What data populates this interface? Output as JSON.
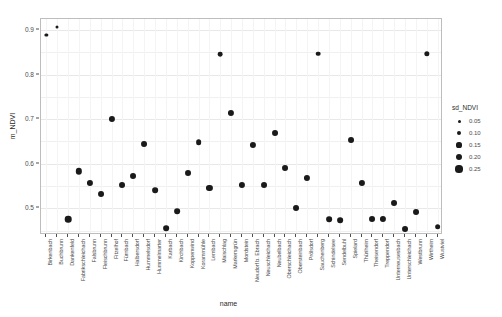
{
  "chart_data": {
    "type": "scatter",
    "title": "",
    "xlabel": "name",
    "ylabel": "m_NDVI",
    "ylim": [
      0.44,
      0.925
    ],
    "yticks": [
      "0.5",
      "0.6",
      "0.7",
      "0.8",
      "0.9"
    ],
    "ytick_values": [
      0.5,
      0.6,
      0.7,
      0.8,
      0.9
    ],
    "grid": true,
    "legend": {
      "title": "sd_NDVI",
      "position": "right",
      "entries": [
        {
          "label": "0.05",
          "value": 0.05,
          "size_px": 3.0
        },
        {
          "label": "0.10",
          "value": 0.1,
          "size_px": 4.2
        },
        {
          "label": "0.15",
          "value": 0.15,
          "size_px": 5.2
        },
        {
          "label": "0.20",
          "value": 0.2,
          "size_px": 6.2
        },
        {
          "label": "0.25",
          "value": 0.25,
          "size_px": 7.2
        }
      ]
    },
    "categories": [
      "Birkenbach",
      "Buchbrunn",
      "Dankenfeld",
      "Fabrikschleichach",
      "Falsbrunn",
      "Fleischbrunn",
      "Fitzelhof",
      "Fürnbach",
      "Halbersdorf",
      "Hummelsdorf",
      "Hummelmarter",
      "Karbach",
      "Kirchbach",
      "Koppenwind",
      "Korammühle",
      "Lembach",
      "Maischlag",
      "Markersgrün",
      "Mordstein",
      "Neudorf b. Ebrach",
      "Neuschleichach",
      "Neubelbach",
      "Oberschleichach",
      "Obersteinbach",
      "Prölsdorf",
      "Sauchenberg",
      "Schindelsee",
      "Sendelbuhl",
      "Spielard",
      "Thüriheim",
      "Theisendorf",
      "Treppendorf",
      "Unterneusesbach",
      "Unterschleichach",
      "Westbrunn",
      "Wirtheim",
      "Wustviel"
    ],
    "points": [
      {
        "name": "Birkenbach",
        "y": 0.889,
        "sd": 0.05
      },
      {
        "name": "Buchbrunn",
        "y": 0.906,
        "sd": 0.04
      },
      {
        "name": "Dankenfeld",
        "y": 0.476,
        "sd": 0.21
      },
      {
        "name": "Fabrikschleichach",
        "y": 0.583,
        "sd": 0.2
      },
      {
        "name": "Falsbrunn",
        "y": 0.556,
        "sd": 0.19
      },
      {
        "name": "Fleischbrunn",
        "y": 0.533,
        "sd": 0.18
      },
      {
        "name": "Fitzelhof",
        "y": 0.701,
        "sd": 0.19
      },
      {
        "name": "Fürnbach",
        "y": 0.552,
        "sd": 0.18
      },
      {
        "name": "Halbersdorf",
        "y": 0.573,
        "sd": 0.18
      },
      {
        "name": "Hummelsdorf",
        "y": 0.645,
        "sd": 0.18
      },
      {
        "name": "Hummelmarter",
        "y": 0.541,
        "sd": 0.17
      },
      {
        "name": "Karbach",
        "y": 0.456,
        "sd": 0.17
      },
      {
        "name": "Kirchbach",
        "y": 0.494,
        "sd": 0.17
      },
      {
        "name": "Koppenwind",
        "y": 0.58,
        "sd": 0.18
      },
      {
        "name": "Korammühle",
        "y": 0.648,
        "sd": 0.17
      },
      {
        "name": "Lembach",
        "y": 0.545,
        "sd": 0.19
      },
      {
        "name": "Maischlag",
        "y": 0.846,
        "sd": 0.12
      },
      {
        "name": "Markersgrün",
        "y": 0.714,
        "sd": 0.19
      },
      {
        "name": "Mordstein",
        "y": 0.553,
        "sd": 0.19
      },
      {
        "name": "Neudorf b. Ebrach",
        "y": 0.643,
        "sd": 0.19
      },
      {
        "name": "Neuschleichach",
        "y": 0.552,
        "sd": 0.18
      },
      {
        "name": "Neubelbach",
        "y": 0.67,
        "sd": 0.18
      },
      {
        "name": "Oberschleichach",
        "y": 0.59,
        "sd": 0.18
      },
      {
        "name": "Obersteinbach",
        "y": 0.5,
        "sd": 0.18
      },
      {
        "name": "Prölsdorf",
        "y": 0.568,
        "sd": 0.19
      },
      {
        "name": "Sauchenberg",
        "y": 0.847,
        "sd": 0.12
      },
      {
        "name": "Schindelsee",
        "y": 0.476,
        "sd": 0.17
      },
      {
        "name": "Sendelbuhl",
        "y": 0.474,
        "sd": 0.17
      },
      {
        "name": "Spielard",
        "y": 0.653,
        "sd": 0.18
      },
      {
        "name": "Thüriheim",
        "y": 0.557,
        "sd": 0.19
      },
      {
        "name": "Theisendorf",
        "y": 0.475,
        "sd": 0.18
      },
      {
        "name": "Treppendorf",
        "y": 0.477,
        "sd": 0.19
      },
      {
        "name": "Unterneusesbach",
        "y": 0.512,
        "sd": 0.18
      },
      {
        "name": "Unterschleichach",
        "y": 0.453,
        "sd": 0.18
      },
      {
        "name": "Westbrunn",
        "y": 0.492,
        "sd": 0.18
      },
      {
        "name": "Wirtheim",
        "y": 0.846,
        "sd": 0.15
      },
      {
        "name": "Wustviel",
        "y": 0.459,
        "sd": 0.17
      }
    ]
  }
}
